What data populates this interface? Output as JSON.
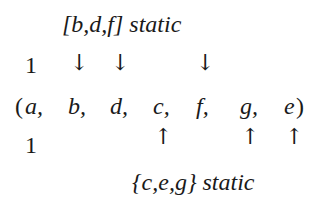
{
  "top_label": {
    "set": "[b,d,f]",
    "word": "static"
  },
  "bottom_label": {
    "set": "{c,e,g}",
    "word": "static"
  },
  "top_row_value": "1",
  "bottom_row_value": "1",
  "sequence": {
    "open": "(",
    "close": ")",
    "items": [
      "a,",
      "b,",
      "d,",
      "c,",
      "f,",
      "g,",
      "e"
    ]
  },
  "down_arrow": "↓",
  "up_arrow": "↑",
  "down_arrow_targets": [
    "b",
    "d",
    "f"
  ],
  "up_arrow_targets": [
    "c",
    "g",
    "e"
  ]
}
